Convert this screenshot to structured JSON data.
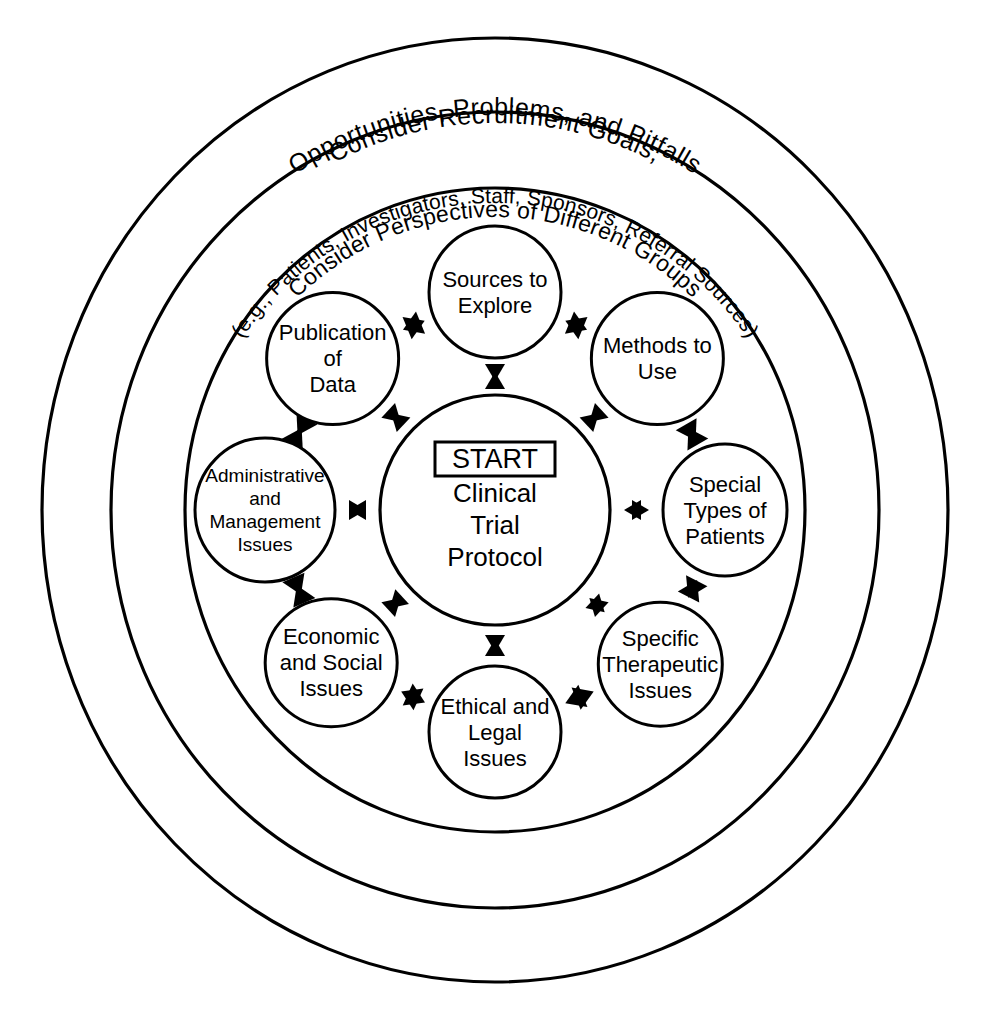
{
  "figure": {
    "type": "concentric-radial-diagram",
    "background_color": "#ffffff",
    "stroke_color": "#000000"
  },
  "rings": [
    {
      "name": "outer-ring",
      "line1": "Consider  Recruitment  Goals,",
      "line2": "Opportunities,  Problems,  and  Pitfalls"
    },
    {
      "name": "middle-ring",
      "line1": "Consider Perspectives of Different Groups",
      "line2": "(e.g., Patients, Investigators, Staff,  Sponsors, Referral Sources)"
    },
    {
      "name": "inner-ring",
      "line1": "",
      "line2": ""
    }
  ],
  "center": {
    "badge": "START",
    "lines": [
      "Clinical",
      "Trial",
      "Protocol"
    ]
  },
  "satellites": [
    {
      "id": "sources-to-explore",
      "lines": [
        "Sources to",
        "Explore"
      ]
    },
    {
      "id": "methods-to-use",
      "lines": [
        "Methods to",
        "Use"
      ]
    },
    {
      "id": "special-types-of-patients",
      "lines": [
        "Special",
        "Types of",
        "Patients"
      ]
    },
    {
      "id": "specific-therapeutic-issues",
      "lines": [
        "Specific",
        "Therapeutic",
        "Issues"
      ]
    },
    {
      "id": "ethical-and-legal-issues",
      "lines": [
        "Ethical and",
        "Legal",
        "Issues"
      ]
    },
    {
      "id": "economic-and-social-issues",
      "lines": [
        "Economic",
        "and Social",
        "Issues"
      ]
    },
    {
      "id": "administrative-and-management-issues",
      "lines": [
        "Administrative",
        "and",
        "Management",
        "Issues"
      ]
    },
    {
      "id": "publication-of-data",
      "lines": [
        "Publication",
        "of",
        "Data"
      ]
    }
  ]
}
